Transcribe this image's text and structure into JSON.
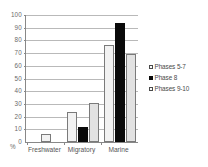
{
  "chart_data": {
    "type": "bar",
    "title": "",
    "xlabel": "",
    "ylabel": "%",
    "ylim": [
      0,
      100
    ],
    "ytick_step": 10,
    "yticks": [
      100,
      90,
      80,
      70,
      60,
      50,
      40,
      30,
      20,
      10,
      0
    ],
    "grid": true,
    "legend_position": "right",
    "categories": [
      "Freshwater",
      "Migratory",
      "Marine"
    ],
    "series": [
      {
        "name": "Phases 5-7",
        "values": [
          6,
          24,
          76
        ],
        "color": "#f2f2f2",
        "pattern": "dotted"
      },
      {
        "name": "Phase 8",
        "values": [
          0,
          12,
          94
        ],
        "color": "#0a0a0a",
        "pattern": "solid"
      },
      {
        "name": "Phases 9-10",
        "values": [
          0,
          31,
          69
        ],
        "color": "#e2e2e2",
        "pattern": "solid-light"
      }
    ]
  },
  "axis": {
    "percent_symbol": "%",
    "zero_label": "0"
  },
  "legend": {
    "items": [
      {
        "label": "Phases 5-7",
        "swatch": "legend-swatch-phases-5-7"
      },
      {
        "label": "Phase 8",
        "swatch": "legend-swatch-phase-8"
      },
      {
        "label": "Phases 9-10",
        "swatch": "legend-swatch-phases-9-10"
      }
    ]
  }
}
